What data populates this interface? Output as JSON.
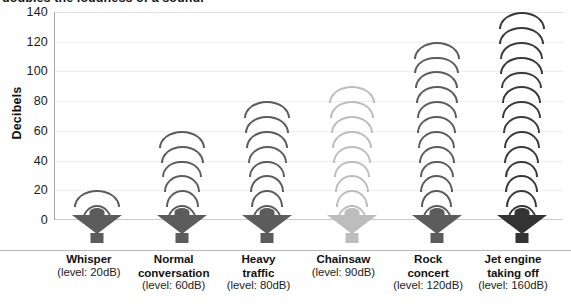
{
  "caption": {
    "text": "doubles the loudness of a sound."
  },
  "chart_data": {
    "type": "bar",
    "title": "",
    "xlabel": "",
    "ylabel": "Decibels",
    "ylim": [
      0,
      140
    ],
    "ytick_values": [
      0,
      20,
      40,
      60,
      80,
      100,
      120,
      140
    ],
    "ytick_labels": [
      "0",
      "20",
      "40",
      "60",
      "80",
      "100",
      "120",
      "140"
    ],
    "grid": true,
    "legend": "none",
    "marker_style": "speaker-with-sound-wave-arcs",
    "categories": [
      "Whisper",
      "Normal conversation",
      "Heavy traffic",
      "Chainsaw",
      "Rock concert",
      "Jet engine taking off"
    ],
    "category_sublabels": [
      "(level: 20dB)",
      "(level: 60dB)",
      "(level: 80dB)",
      "(level: 90dB)",
      "(level: 120dB)",
      "(level: 160dB)"
    ],
    "category_lines": [
      [
        "Whisper",
        "(level: 20dB)"
      ],
      [
        "Normal",
        "conversation",
        "(level: 60dB)"
      ],
      [
        "Heavy",
        "traffic",
        "(level: 80dB)"
      ],
      [
        "Chainsaw",
        "(level: 90dB)"
      ],
      [
        "Rock",
        "concert",
        "(level: 120dB)"
      ],
      [
        "Jet engine",
        "taking off",
        "(level: 160dB)"
      ]
    ],
    "values": [
      20,
      60,
      80,
      90,
      120,
      140
    ],
    "stated_levels_db": [
      20,
      60,
      80,
      90,
      120,
      160
    ],
    "arc_counts": [
      2,
      6,
      8,
      9,
      12,
      14
    ],
    "series_colors": [
      "#5c5c5c",
      "#5c5c5c",
      "#5c5c5c",
      "#bdbdbd",
      "#5c5c5c",
      "#3a3a3a"
    ],
    "units": "dB"
  },
  "colors": {
    "plot_background": "#ffffff",
    "gridline": "#efefef",
    "axis_line": "#a8a8a8",
    "baseline": "#c9c9c9",
    "text": "#1a1a1a",
    "icon_dark": "#4e4e4e",
    "icon_light": "#bdbdbd",
    "icon_darkest": "#333333"
  }
}
